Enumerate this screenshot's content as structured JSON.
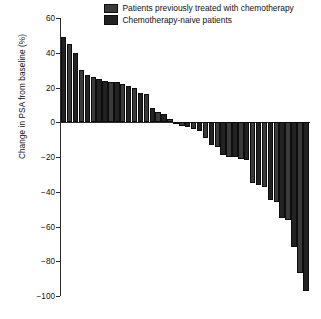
{
  "chart_data": {
    "type": "bar",
    "chart_style": "waterfall",
    "title": "",
    "xlabel": "",
    "ylabel": "Change in PSA from baseline (%)",
    "ylim": [
      -100,
      60
    ],
    "yticks": [
      60,
      40,
      20,
      0,
      -20,
      -40,
      -60,
      -80,
      -100
    ],
    "ytick_labels": [
      "60",
      "40",
      "20",
      "0",
      "−20",
      "−40",
      "−60",
      "−80",
      "−100"
    ],
    "grid": false,
    "legend_position": "top-center",
    "x_axis_visible": false,
    "categories": [
      "1",
      "2",
      "3",
      "4",
      "5",
      "6",
      "7",
      "8",
      "9",
      "10",
      "11",
      "12",
      "13",
      "14",
      "15",
      "16",
      "17",
      "18",
      "19",
      "20",
      "21",
      "22",
      "23",
      "24",
      "25",
      "26",
      "27",
      "28",
      "29",
      "30",
      "31",
      "32",
      "33",
      "34",
      "35",
      "36",
      "37",
      "38",
      "39",
      "40",
      "41",
      "42"
    ],
    "values": [
      49,
      45,
      40,
      30,
      27,
      26,
      25,
      24,
      23,
      23,
      22,
      21,
      20,
      17,
      16,
      8,
      6,
      5,
      2,
      -1,
      -2,
      -3,
      -4,
      -5,
      -9,
      -13,
      -14,
      -19,
      -20,
      -20,
      -21,
      -22,
      -35,
      -36,
      -37,
      -45,
      -46,
      -55,
      -56,
      -72,
      -87,
      -97
    ],
    "series": [
      {
        "name": "Patients previously treated with chemotherapy",
        "color": "#3a3a3a"
      },
      {
        "name": "Chemotherapy-naive patients",
        "color": "#222222"
      }
    ],
    "bar_groups": [
      1,
      0,
      1,
      0,
      1,
      0,
      1,
      1,
      0,
      1,
      0,
      1,
      0,
      1,
      0,
      1,
      0,
      1,
      0,
      1,
      0,
      1,
      0,
      1,
      0,
      1,
      0,
      1,
      0,
      1,
      0,
      1,
      0,
      1,
      0,
      1,
      0,
      1,
      0,
      1,
      0,
      1
    ]
  },
  "legend": {
    "items": [
      {
        "label": "Patients previously treated with chemotherapy",
        "swatch_name": "legend-swatch-pretreated"
      },
      {
        "label": "Chemotherapy-naive patients",
        "swatch_name": "legend-swatch-naive"
      }
    ]
  },
  "axis": {
    "y_title": "Change in PSA from baseline (%)"
  }
}
